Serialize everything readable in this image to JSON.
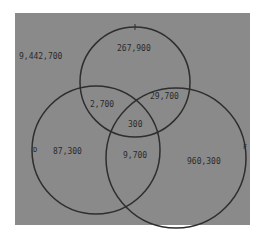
{
  "diagram": {
    "type": "venn-3",
    "background_color": "#8a8a8a",
    "line_color": "#2e2e2e",
    "outside": "9,442,700",
    "circles": [
      {
        "id": "top",
        "label": ""
      },
      {
        "id": "left",
        "label": "D"
      },
      {
        "id": "right",
        "label": "F"
      }
    ],
    "regions": {
      "top_only": "267,900",
      "left_only": "87,300",
      "right_only": "960,300",
      "top_left": "2,700",
      "top_right": "29,700",
      "left_right": "9,700",
      "all_three": "300"
    }
  }
}
